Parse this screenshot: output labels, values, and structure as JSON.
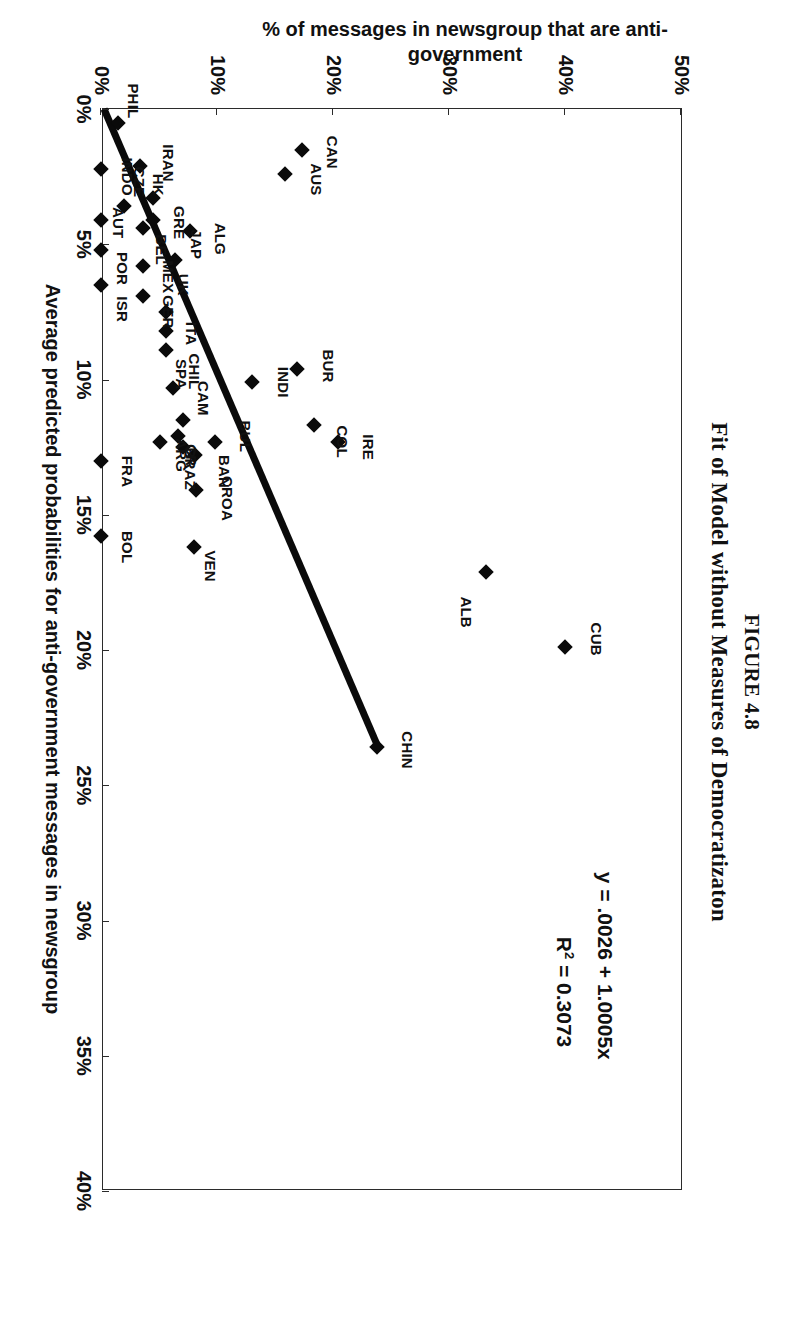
{
  "figure": {
    "number_label": "FIGURE 4.8",
    "caption": "Fit of Model without Measures of Democratizaton"
  },
  "annotations": {
    "equation": "y = .0026 + 1.0005x",
    "r_squared_prefix": "R",
    "r_squared_exp": "2",
    "r_squared_value": " = 0.3073"
  },
  "chart_data": {
    "type": "scatter",
    "title": "Fit of Model without Measures of Democratizaton",
    "xlabel": "Average predicted probabilities for anti-government messages in newsgroup",
    "ylabel": "% of messages in newsgroup that are anti-government",
    "xlim": [
      0,
      40
    ],
    "ylim": [
      0,
      50
    ],
    "xticks": [
      "0%",
      "5%",
      "10%",
      "15%",
      "20%",
      "25%",
      "30%",
      "35%",
      "40%"
    ],
    "xtick_values": [
      0,
      5,
      10,
      15,
      20,
      25,
      30,
      35,
      40
    ],
    "yticks": [
      "0%",
      "10%",
      "20%",
      "30%",
      "40%",
      "50%"
    ],
    "ytick_values": [
      0,
      10,
      20,
      30,
      40,
      50
    ],
    "grid": false,
    "legend": null,
    "units": "percent",
    "trendline": {
      "equation": "y = .0026 + 1.0005x",
      "r_squared": 0.3073,
      "intercept_pct": 0.26,
      "slope": 1.0005,
      "x_start": 0,
      "x_end": 23.6,
      "y_start": 0.26,
      "y_end": 23.9
    },
    "points": [
      {
        "label": "CUB",
        "x": 19.9,
        "y": 40.0,
        "lx": -0.3,
        "ly": 2.7
      },
      {
        "label": "ALB",
        "x": 17.1,
        "y": 33.2,
        "lx": 1.5,
        "ly": -1.7
      },
      {
        "label": "CHIN",
        "x": 23.6,
        "y": 23.8,
        "lx": 0.1,
        "ly": 2.6
      },
      {
        "label": "CAN",
        "x": 1.5,
        "y": 17.3,
        "lx": 0.1,
        "ly": 2.6
      },
      {
        "label": "AUS",
        "x": 2.4,
        "y": 15.9,
        "lx": 0.2,
        "ly": 2.6
      },
      {
        "label": "BUR",
        "x": 9.6,
        "y": 16.9,
        "lx": -0.1,
        "ly": 2.7
      },
      {
        "label": "IRE",
        "x": 12.3,
        "y": 20.4,
        "lx": 0.2,
        "ly": 2.6
      },
      {
        "label": "COL",
        "x": 11.7,
        "y": 18.4,
        "lx": 0.6,
        "ly": 2.4
      },
      {
        "label": "INDI",
        "x": 10.1,
        "y": 13.0,
        "lx": 0.0,
        "ly": 2.7
      },
      {
        "label": "BUL",
        "x": 12.3,
        "y": 9.8,
        "lx": -0.2,
        "ly": 2.6
      },
      {
        "label": "BAN",
        "x": 12.8,
        "y": 8.1,
        "lx": 0.6,
        "ly": 2.5
      },
      {
        "label": "CROA",
        "x": 14.1,
        "y": 8.2,
        "lx": 0.3,
        "ly": 2.7
      },
      {
        "label": "VEN",
        "x": 16.2,
        "y": 8.0,
        "lx": 0.7,
        "ly": 1.4
      },
      {
        "label": "BRAZ",
        "x": 12.5,
        "y": 7.1,
        "lx": 0.8,
        "ly": 0.6
      },
      {
        "label": "CAM",
        "x": 11.5,
        "y": 7.1,
        "lx": -0.8,
        "ly": 1.7
      },
      {
        "label": "CR",
        "x": 12.1,
        "y": 6.6,
        "lx": 0.7,
        "ly": 1.2
      },
      {
        "label": "CHIL",
        "x": 10.3,
        "y": 6.2,
        "lx": -0.6,
        "ly": 1.8
      },
      {
        "label": "ITA",
        "x": 8.2,
        "y": 5.6,
        "lx": 0.1,
        "ly": 2.2
      },
      {
        "label": "SPA",
        "x": 8.9,
        "y": 5.6,
        "lx": 0.9,
        "ly": 1.3
      },
      {
        "label": "ARG",
        "x": 12.3,
        "y": 5.1,
        "lx": 0.5,
        "ly": 1.8
      },
      {
        "label": "ALG",
        "x": 4.5,
        "y": 7.7,
        "lx": 0.3,
        "ly": 2.6
      },
      {
        "label": "JAP",
        "x": 5.6,
        "y": 6.4,
        "lx": -0.6,
        "ly": 1.8
      },
      {
        "label": "UK",
        "x": 7.5,
        "y": 5.6,
        "lx": -1.0,
        "ly": 1.5
      },
      {
        "label": "IRAN",
        "x": 3.3,
        "y": 4.5,
        "lx": -1.3,
        "ly": 1.3
      },
      {
        "label": "GRE",
        "x": 4.1,
        "y": 4.5,
        "lx": 0.1,
        "ly": 2.2
      },
      {
        "label": "BEL",
        "x": 4.4,
        "y": 3.6,
        "lx": 0.8,
        "ly": 1.6
      },
      {
        "label": "MEX",
        "x": 5.8,
        "y": 3.6,
        "lx": 0.4,
        "ly": 2.2
      },
      {
        "label": "GER",
        "x": 6.9,
        "y": 3.6,
        "lx": 0.6,
        "ly": 2.2
      },
      {
        "label": "HK",
        "x": 2.1,
        "y": 3.4,
        "lx": 0.7,
        "ly": 1.5
      },
      {
        "label": "CZE",
        "x": 3.6,
        "y": 2.0,
        "lx": -0.9,
        "ly": 1.3
      },
      {
        "label": "AUT",
        "x": 4.1,
        "y": 0.0,
        "lx": 0.1,
        "ly": 1.5
      },
      {
        "label": "POR",
        "x": 5.2,
        "y": 0.0,
        "lx": 0.7,
        "ly": 1.8
      },
      {
        "label": "ISR",
        "x": 6.5,
        "y": 0.0,
        "lx": 0.9,
        "ly": 1.8
      },
      {
        "label": "FRA",
        "x": 13.0,
        "y": 0.0,
        "lx": 0.4,
        "ly": 2.2
      },
      {
        "label": "BOL",
        "x": 15.8,
        "y": 0.0,
        "lx": 0.4,
        "ly": 2.2
      },
      {
        "label": "INDO",
        "x": 2.2,
        "y": 0.0,
        "lx": 0.3,
        "ly": 2.2
      },
      {
        "label": "PHIL",
        "x": 0.5,
        "y": 1.5,
        "lx": -0.8,
        "ly": 1.3
      }
    ]
  }
}
